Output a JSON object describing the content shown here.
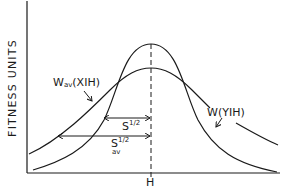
{
  "figure": {
    "y_axis_label": "FITNESS UNITS",
    "x_axis_tick_label": "H",
    "curves": [
      {
        "id": "wav",
        "label_main": "W",
        "label_sub": "av",
        "label_args": "(XIH)",
        "shape": "wide bell curve centered at H"
      },
      {
        "id": "w",
        "label_main": "W",
        "label_args": "(YIH)",
        "shape": "narrow, taller bell curve centered at H"
      }
    ],
    "arrows": [
      {
        "id": "s-half",
        "label_base": "S",
        "label_sup": "1/2",
        "label_sub": ""
      },
      {
        "id": "sav-half",
        "label_base": "S",
        "label_sup": "1/2",
        "label_sub": "av"
      }
    ],
    "colors": {
      "line": "#1a1a1a",
      "background": "#ffffff"
    }
  }
}
